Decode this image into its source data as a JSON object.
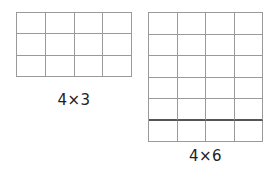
{
  "figures": [
    {
      "id": "grid-a",
      "label": "4×3",
      "columns": 4,
      "rows": 3,
      "thick_line_after_row": null
    },
    {
      "id": "grid-b",
      "label": "4×6",
      "columns": 4,
      "rows": 6,
      "thick_line_after_row": 5
    }
  ],
  "colors": {
    "grid_line": "#9a9a9a",
    "thick_line": "#555555",
    "label_text": "#222222",
    "background": "#ffffff"
  }
}
